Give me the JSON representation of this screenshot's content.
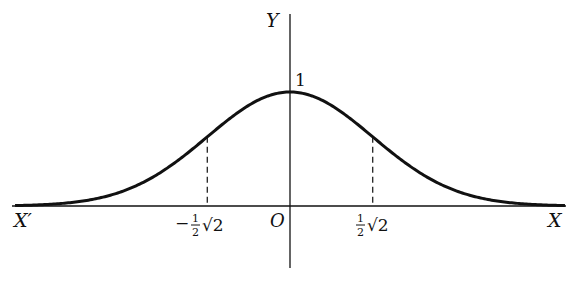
{
  "figure": {
    "type": "graph",
    "function": "y = e^{-x^2}",
    "axes": {
      "x_axis_label_pos": "X",
      "x_axis_label_neg": "X′",
      "y_axis_label": "Y",
      "origin_label": "O"
    },
    "peak_label": "1",
    "tick_labels": {
      "neg": {
        "sign": "−",
        "num": "1",
        "den": "2",
        "root": "√2"
      },
      "pos": {
        "num": "1",
        "den": "2",
        "root": "√2"
      }
    },
    "colors": {
      "curve": "#111111",
      "axis": "#111111",
      "background": "#ffffff"
    },
    "geometry": {
      "origin_px": [
        290,
        206
      ],
      "x_unit_px": 117,
      "y_unit_px": 114,
      "x_range": [
        -2.35,
        2.35
      ],
      "inflection_x": [
        -0.7071,
        0.7071
      ],
      "inflection_y": 0.6065
    }
  }
}
